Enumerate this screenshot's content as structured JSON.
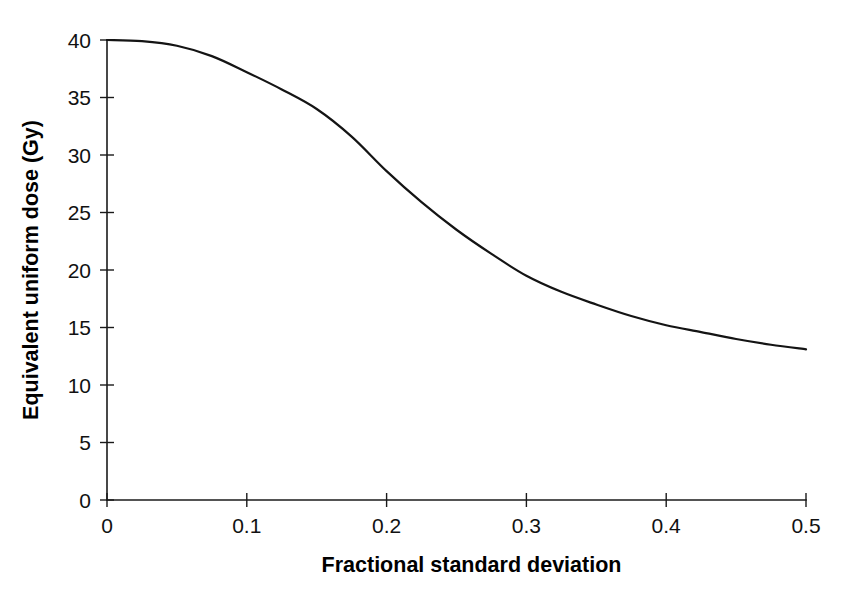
{
  "figure": {
    "background_color": "#ffffff",
    "curve_color": "#141414",
    "axis_color": "#1a1a1a"
  },
  "chart_data": {
    "type": "line",
    "title": "",
    "subtitle": "",
    "xlabel": "Fractional standard deviation",
    "ylabel": "Equivalent uniform dose (Gy)",
    "xlim": [
      0,
      0.5
    ],
    "ylim": [
      0,
      40
    ],
    "xticks": [
      0,
      0.1,
      0.2,
      0.3,
      0.4,
      0.5
    ],
    "xtick_labels": [
      "0",
      "0.1",
      "0.2",
      "0.3",
      "0.4",
      "0.5"
    ],
    "yticks": [
      0,
      5,
      10,
      15,
      20,
      25,
      30,
      35,
      40
    ],
    "ytick_labels": [
      "0",
      "5",
      "10",
      "15",
      "20",
      "25",
      "30",
      "35",
      "40"
    ],
    "grid": false,
    "legend": false,
    "legend_position": "none",
    "annotations": [],
    "series": [
      {
        "name": "Equivalent uniform dose",
        "x": [
          0.0,
          0.025,
          0.05,
          0.075,
          0.1,
          0.125,
          0.15,
          0.175,
          0.2,
          0.225,
          0.25,
          0.275,
          0.3,
          0.325,
          0.35,
          0.375,
          0.4,
          0.425,
          0.45,
          0.475,
          0.5
        ],
        "values": [
          40.0,
          39.9,
          39.5,
          38.6,
          37.2,
          35.7,
          34.0,
          31.6,
          28.6,
          25.9,
          23.5,
          21.4,
          19.5,
          18.1,
          17.0,
          16.0,
          15.2,
          14.6,
          14.0,
          13.5,
          13.1
        ]
      }
    ]
  }
}
